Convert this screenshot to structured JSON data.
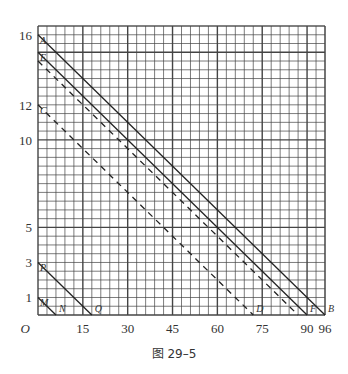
{
  "caption": "图 29–5",
  "chart_data": {
    "type": "line",
    "title": "",
    "xlabel": "",
    "ylabel": "",
    "origin_label": "O",
    "xlim": [
      0,
      96
    ],
    "ylim": [
      0,
      16.5
    ],
    "grid": true,
    "x_ticks": [
      15,
      30,
      45,
      60,
      75,
      90,
      96
    ],
    "y_ticks": [
      1,
      3,
      5,
      10,
      12,
      16
    ],
    "series": [
      {
        "name": "AB",
        "style": "solid",
        "points": [
          [
            0,
            16
          ],
          [
            96,
            0
          ]
        ],
        "labels": [
          "A",
          "B"
        ]
      },
      {
        "name": "EF",
        "style": "solid",
        "points": [
          [
            0,
            15
          ],
          [
            90,
            0
          ]
        ],
        "labels": [
          "E",
          "F"
        ]
      },
      {
        "name": "EF-dashed",
        "style": "dashed",
        "points": [
          [
            0,
            14.5
          ],
          [
            87,
            0
          ]
        ],
        "labels": []
      },
      {
        "name": "CD",
        "style": "dashed",
        "points": [
          [
            0,
            12
          ],
          [
            72,
            0
          ]
        ],
        "labels": [
          "C",
          "D"
        ]
      },
      {
        "name": "PQ",
        "style": "solid",
        "points": [
          [
            0,
            3
          ],
          [
            18,
            0
          ]
        ],
        "labels": [
          "P",
          "Q"
        ]
      },
      {
        "name": "MN",
        "style": "solid",
        "points": [
          [
            0,
            1
          ],
          [
            6,
            0
          ]
        ],
        "labels": [
          "M",
          "N"
        ]
      }
    ]
  }
}
